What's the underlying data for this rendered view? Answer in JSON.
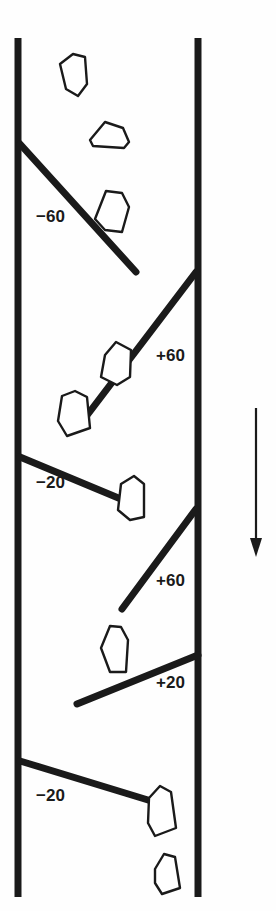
{
  "figure": {
    "name": "structural-core-log-diagram",
    "background_color": "#fefefe",
    "ink_color": "#1a1a1a",
    "width": 276,
    "height": 911
  },
  "boundaries": [
    {
      "name": "left-boundary-line",
      "x": 18,
      "y1": 38,
      "y2": 897,
      "width": 7
    },
    {
      "name": "right-boundary-line",
      "x": 198,
      "y1": 38,
      "y2": 897,
      "width": 7
    }
  ],
  "flow_arrow": {
    "name": "downward-flow-arrow",
    "x": 256,
    "y_start": 408,
    "y_end": 556,
    "direction": "down"
  },
  "fractures": [
    {
      "id": "fracture-1",
      "label": "−60",
      "label_x": 36,
      "label_y": 222,
      "x1": 20,
      "y1": 144,
      "x2": 136,
      "y2": 272
    },
    {
      "id": "fracture-2",
      "label": "+60",
      "label_x": 156,
      "label_y": 361,
      "x1": 196,
      "y1": 272,
      "x2": 85,
      "y2": 418
    },
    {
      "id": "fracture-3",
      "label": "−20",
      "label_x": 36,
      "label_y": 488,
      "x1": 20,
      "y1": 457,
      "x2": 128,
      "y2": 502
    },
    {
      "id": "fracture-4",
      "label": "+60",
      "label_x": 156,
      "label_y": 586,
      "x1": 196,
      "y1": 509,
      "x2": 122,
      "y2": 609
    },
    {
      "id": "fracture-5",
      "label": "+20",
      "label_x": 156,
      "label_y": 688,
      "x1": 198,
      "y1": 655,
      "x2": 77,
      "y2": 704
    },
    {
      "id": "fracture-6",
      "label": "−20",
      "label_x": 36,
      "label_y": 801,
      "x1": 20,
      "y1": 761,
      "x2": 148,
      "y2": 800
    }
  ],
  "clasts": [
    {
      "id": "clast-1",
      "points": "66,89 60,64 73,54 85,57 87,84 78,96"
    },
    {
      "id": "clast-2",
      "points": "90,140 105,122 123,128 129,142 124,148 93,146"
    },
    {
      "id": "clast-3",
      "points": "95,219 106,191 122,193 129,207 122,232 105,230"
    },
    {
      "id": "clast-4",
      "points": "105,355 116,342 131,350 130,377 117,385 101,377"
    },
    {
      "id": "clast-5",
      "points": "58,421 62,396 75,391 87,397 90,428 67,436"
    },
    {
      "id": "clast-6",
      "points": "121,484 134,476 144,484 144,517 130,520 118,510"
    },
    {
      "id": "clast-7",
      "points": "101,648 110,626 121,627 128,640 126,672 110,672"
    },
    {
      "id": "clast-8",
      "points": "149,798 160,786 171,792 176,828 155,836 148,823"
    },
    {
      "id": "clast-9",
      "points": "155,869 164,854 175,857 180,888 162,894 155,883"
    }
  ]
}
